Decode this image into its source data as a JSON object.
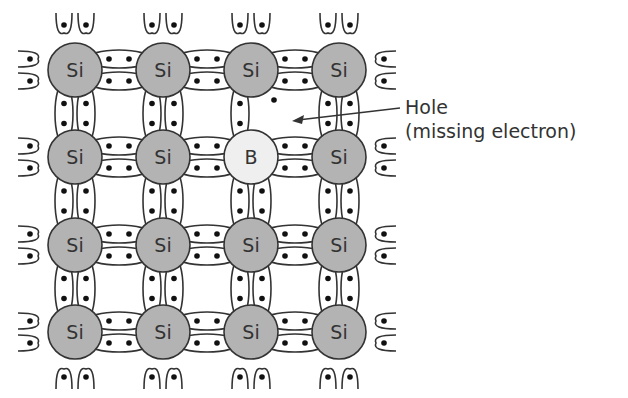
{
  "diagram": {
    "lattice": {
      "rows": 4,
      "cols": 4,
      "col_x": [
        75,
        163,
        251,
        339
      ],
      "row_y": [
        70,
        157,
        245,
        332
      ],
      "atom_radius": 27,
      "atoms": [
        [
          "Si",
          "Si",
          "Si",
          "Si"
        ],
        [
          "Si",
          "Si",
          "B",
          "Si"
        ],
        [
          "Si",
          "Si",
          "Si",
          "Si"
        ],
        [
          "Si",
          "Si",
          "Si",
          "Si"
        ]
      ],
      "missing_bond": {
        "between": [
          [
            0,
            2
          ],
          [
            1,
            2
          ]
        ],
        "side": "right"
      }
    },
    "colors": {
      "si_fill": "#b3b3b3",
      "b_fill": "#efefef",
      "stroke": "#333333",
      "electron": "#111111"
    },
    "hole_dot": {
      "x": 274,
      "y": 100
    },
    "annotation": {
      "line1": "Hole",
      "line2": "(missing electron)",
      "arrow_from": [
        400,
        108
      ],
      "arrow_to": [
        292,
        121
      ]
    }
  }
}
